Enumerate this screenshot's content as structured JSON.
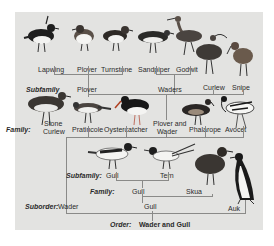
{
  "diagram": {
    "species_row1": [
      "Lapwing",
      "Plover",
      "Turnstone",
      "Sandpiper",
      "Godwit",
      "Curlew",
      "Snipe"
    ],
    "species_row2": [
      "Stone Curlew",
      "Pratincole",
      "Oystercatcher",
      "Plover and Wader",
      "Phalarope",
      "Avocet"
    ],
    "species_row3": [
      "Gull",
      "Tern",
      "Skua",
      "Auk"
    ],
    "levels": {
      "subfamily_label": "Subfamily",
      "family_label": "Family:",
      "suborder_label": "Suborder:",
      "order_label": "Order:"
    },
    "labels": {
      "lapwing": "Lapwing",
      "plover": "Plover",
      "turnstone": "Turnstone",
      "sandpiper": "Sandpiper",
      "godwit": "Godwit",
      "curlew": "Curlew",
      "snipe": "Snipe",
      "subfamily_plover": "Plover",
      "subfamily_waders": "Waders",
      "stone": "Stone",
      "curlew2": "Curlew",
      "pratincole": "Pratincole",
      "oystercatcher": "Oystercatcher",
      "plover_and": "Plover and",
      "wader": "Wader",
      "phalarope": "Phalarope",
      "avocet": "Avocet",
      "subfamily_gull_label": "Subfamily:",
      "gull": "Gull",
      "tern": "Tern",
      "family_gull_label": "Family:",
      "family_gull": "Gull",
      "skua": "Skua",
      "suborder_label": "Suborder:",
      "suborder_wader": "Wader",
      "suborder_gull": "Gull",
      "auk": "Auk",
      "order_label": "Order:",
      "order_value": "Wader and Gull"
    }
  }
}
